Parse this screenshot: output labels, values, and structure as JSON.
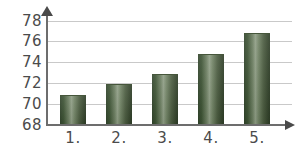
{
  "chart_data": {
    "type": "bar",
    "title": "",
    "xlabel": "",
    "ylabel": "",
    "categories": [
      "1.",
      "2.",
      "3.",
      "4.",
      "5."
    ],
    "values": [
      70.9,
      71.9,
      72.9,
      74.85,
      76.8
    ],
    "ylim": [
      68,
      78
    ],
    "yticks": [
      68,
      70,
      72,
      74,
      76,
      78
    ],
    "ytick_labels": [
      "68",
      "70",
      "72",
      "74",
      "76",
      "78"
    ],
    "grid": true,
    "legend": "none",
    "bar_color": "#4a5b3f",
    "gridline_color": "#c9c9c9",
    "axis_color": "#6d6d6d",
    "background_color": "#ffffff"
  },
  "axes": {
    "y_ticks": [
      {
        "label": "78",
        "value": 78
      },
      {
        "label": "76",
        "value": 76
      },
      {
        "label": "74",
        "value": 74
      },
      {
        "label": "72",
        "value": 72
      },
      {
        "label": "70",
        "value": 70
      },
      {
        "label": "68",
        "value": 68
      }
    ],
    "x_ticks": [
      {
        "label": "1."
      },
      {
        "label": "2."
      },
      {
        "label": "3."
      },
      {
        "label": "4."
      },
      {
        "label": "5."
      }
    ]
  }
}
